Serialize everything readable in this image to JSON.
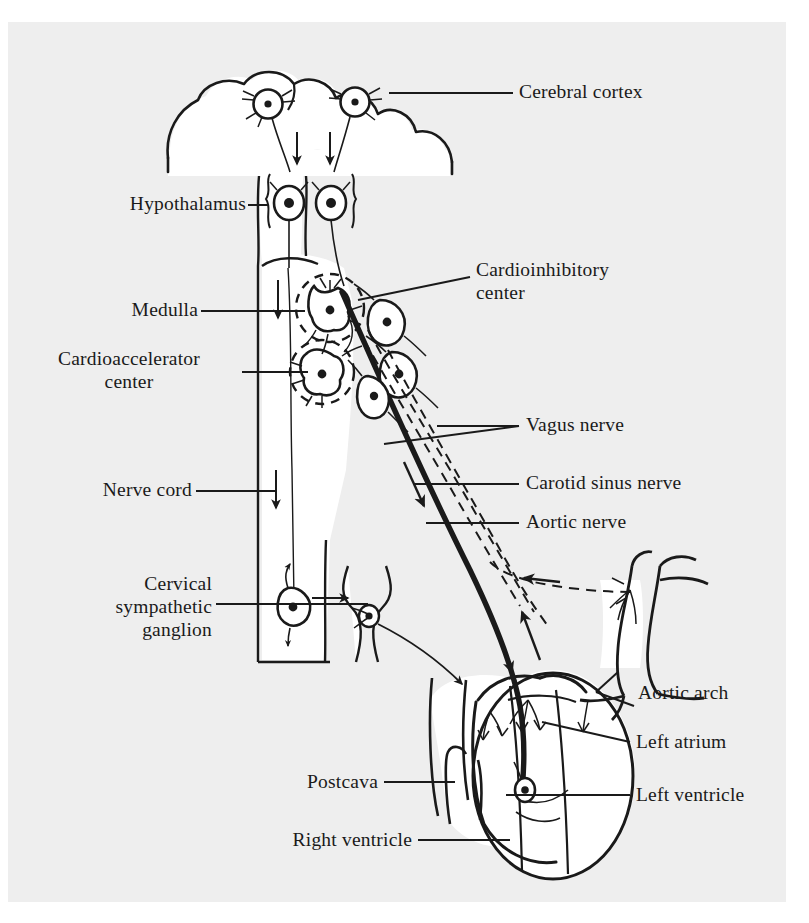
{
  "figure": {
    "type": "anatomical-diagram",
    "background_color": "#eeeeee",
    "ink_color": "#1a1a1a",
    "paper_color": "#ffffff"
  },
  "labels": {
    "cerebral_cortex": "Cerebral cortex",
    "hypothalamus": "Hypothalamus",
    "cardioinhibitory_center": "Cardioinhibitory\ncenter",
    "medulla": "Medulla",
    "cardioaccelerator_center": "Cardioaccelerator\ncenter",
    "vagus_nerve": "Vagus nerve",
    "carotid_sinus_nerve": "Carotid sinus nerve",
    "aortic_nerve": "Aortic nerve",
    "nerve_cord": "Nerve cord",
    "cervical_sympathetic_ganglion": "Cervical\nsympathetic\nganglion",
    "aortic_arch": "Aortic arch",
    "left_atrium": "Left atrium",
    "left_ventricle": "Left ventricle",
    "postcava": "Postcava",
    "right_ventricle": "Right ventricle"
  },
  "structures": {
    "cortex_neurons": 2,
    "hypothalamus_neurons": 2,
    "medulla_centers": 2,
    "vagal_sensory_neurons": 3,
    "efferent_arrow_count": 6,
    "afferent_dashed_pathways": 2
  }
}
